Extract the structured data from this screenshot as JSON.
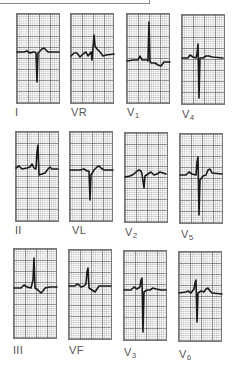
{
  "figure": {
    "colors": {
      "trace": "#1a1a1a",
      "grid_major": "#505050",
      "grid_minor": "#969696",
      "label": "#555555"
    },
    "leads": [
      {
        "id": "I",
        "label": "I",
        "sub": "",
        "box": [
          16,
          13
        ],
        "label_pos": [
          15,
          106
        ],
        "path": "M17,52 L24,52 L27,51 L30,53 L33,52 L35,52 L36,53 L37,82 L38,53 L40,51 L42,49 L44,48 L46,50 L48,52 L59,52"
      },
      {
        "id": "VR",
        "label": "VR",
        "sub": "",
        "box": [
          70,
          13
        ],
        "label_pos": [
          71,
          106
        ],
        "path": "M71,56 L74,53 L77,53 L80,57 L83,54 L86,52 L88,56 L91,52 L92,60 L93,48 L94,35 L95,46 L97,49 L100,52 L103,56 L106,55 L114,54"
      },
      {
        "id": "V1",
        "label": "V",
        "sub": "1",
        "box": [
          126,
          13
        ],
        "label_pos": [
          127,
          106
        ],
        "path": "M127,61 L133,60 L138,60 L140,56 L142,60 L147,60 L148,61 L149,22 L150,61 L151,63 L155,63 L158,65 L161,66 L164,62 L170,62"
      },
      {
        "id": "V4",
        "label": "V",
        "sub": "4",
        "box": [
          181,
          14
        ],
        "label_pos": [
          182,
          108
        ],
        "path": "M182,58 L188,58 L190,55 L193,57 L196,58 L197,54 L198,44 L199,98 L200,58 L203,58 L206,56 L209,56 L212,57 L223,58"
      },
      {
        "id": "II",
        "label": "II",
        "sub": "",
        "box": [
          15,
          131
        ],
        "label_pos": [
          15,
          224
        ],
        "path": "M16,168 L19,166 L22,169 L27,168 L30,167 L32,164 L34,168 L36,169 L37,152 L38,145 L39,175 L42,174 L45,173 L48,169 L50,167 L52,169 L58,169"
      },
      {
        "id": "VL",
        "label": "VL",
        "sub": "",
        "box": [
          69,
          131
        ],
        "label_pos": [
          72,
          224
        ],
        "path": "M70,170 L80,170 L84,169 L87,171 L89,171 L90,200 L91,175 L94,170 L97,167 L99,166 L101,168 L104,170 L113,170"
      },
      {
        "id": "V2",
        "label": "V",
        "sub": "2",
        "box": [
          124,
          132
        ],
        "label_pos": [
          125,
          226
        ],
        "path": "M125,177 L130,176 L134,174 L137,171 L139,170 L141,171 L142,174 L144,188 L145,176 L148,174 L151,172 L154,175 L157,174 L160,172 L163,173 L166,174"
      },
      {
        "id": "V5",
        "label": "V",
        "sub": "5",
        "box": [
          179,
          133
        ],
        "label_pos": [
          181,
          228
        ],
        "path": "M180,175 L186,175 L189,172 L192,174 L196,175 L197,162 L198,157 L199,215 L200,180 L203,176 L206,175 L208,170 L210,169 L212,173 L222,174"
      },
      {
        "id": "III",
        "label": "III",
        "sub": "",
        "box": [
          13,
          248
        ],
        "label_pos": [
          13,
          344
        ],
        "path": "M14,288 L21,288 L24,285 L27,287 L31,288 L33,280 L34,258 L35,288 L38,290 L41,293 L43,291 L45,288 L50,287 L57,287"
      },
      {
        "id": "VF",
        "label": "VF",
        "sub": "",
        "box": [
          68,
          249
        ],
        "label_pos": [
          69,
          344
        ],
        "path": "M69,286 L75,286 L77,284 L79,285 L81,287 L84,286 L86,284 L87,272 L88,268 L89,288 L92,290 L95,292 L97,289 L99,286 L103,286 L111,286"
      },
      {
        "id": "V3",
        "label": "V",
        "sub": "3",
        "box": [
          123,
          250
        ],
        "label_pos": [
          124,
          346
        ],
        "path": "M124,290 L131,290 L134,287 L137,289 L140,287 L141,280 L142,278 L143,332 L144,292 L147,290 L150,290 L153,288 L156,289 L161,290 L166,290"
      },
      {
        "id": "V6",
        "label": "V",
        "sub": "6",
        "box": [
          178,
          251
        ],
        "label_pos": [
          179,
          348
        ],
        "path": "M179,293 L186,292 L188,291 L191,293 L194,289 L195,283 L196,280 L197,322 L198,293 L201,291 L204,292 L206,289 L208,288 L210,291 L212,293 L222,294"
      }
    ]
  }
}
